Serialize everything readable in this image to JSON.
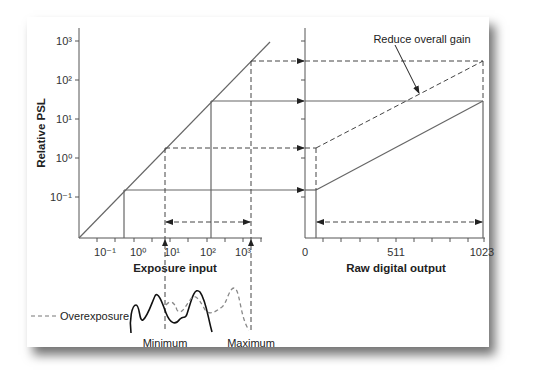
{
  "figure": {
    "left_panel": {
      "ylabel": "Relative PSL",
      "xlabel": "Exposure input",
      "y_ticks": [
        "10³",
        "10²",
        "10¹",
        "10⁰",
        "10⁻¹"
      ],
      "x_ticks": [
        "10⁻¹",
        "10⁰",
        "10¹",
        "10²",
        "10³"
      ]
    },
    "right_panel": {
      "xlabel": "Raw digital output",
      "x_ticks": [
        "0",
        "511",
        "1023"
      ],
      "annotation": "Reduce overall gain"
    },
    "histogram": {
      "legend": "Overexposure",
      "min_label": "Minimum",
      "max_label": "Maximum"
    },
    "colors": {
      "line": "#555555",
      "curve": "#111111",
      "dashed_curve": "#888888",
      "background": "#ffffff"
    }
  }
}
